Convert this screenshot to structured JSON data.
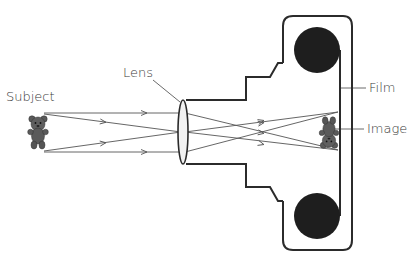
{
  "diagram": {
    "labels": {
      "subject": "Subject",
      "lens": "Lens",
      "film": "Film",
      "image": "Image"
    },
    "colors": {
      "outline": "#2b2b2b",
      "ray": "#555555",
      "reel": "#1e1e1e",
      "bear": "#5a5a5a",
      "text": "#3a3a3a"
    }
  }
}
